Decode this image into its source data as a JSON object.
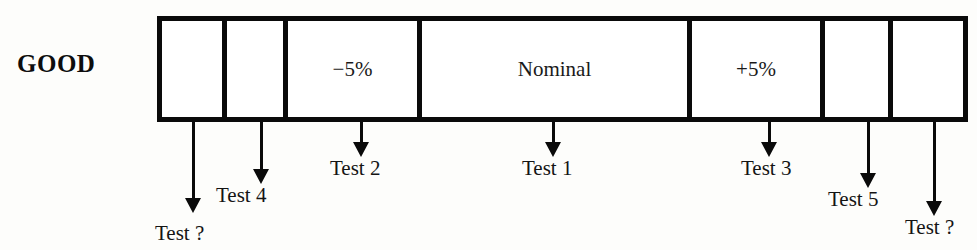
{
  "diagram": {
    "side_label": "GOOD",
    "bar": {
      "cells": [
        {
          "name": "cell-blank-left-outer",
          "label": "",
          "width": 65
        },
        {
          "name": "cell-blank-left-inner",
          "label": "",
          "width": 61
        },
        {
          "name": "cell-minus-5",
          "label": "−5%",
          "width": 134
        },
        {
          "name": "cell-nominal",
          "label": "Nominal",
          "width": 270
        },
        {
          "name": "cell-plus-5",
          "label": "+5%",
          "width": 133
        },
        {
          "name": "cell-blank-right-inner",
          "label": "",
          "width": 68
        },
        {
          "name": "cell-blank-right-outer",
          "label": "",
          "width": 70
        }
      ]
    },
    "pointers": [
      {
        "name": "pointer-test-unknown-left",
        "label": "Test ?",
        "x": 193,
        "shaft_top": 122,
        "shaft_height": 76,
        "label_x": 155,
        "label_y": 221
      },
      {
        "name": "pointer-test-4",
        "label": "Test 4",
        "x": 261,
        "shaft_top": 122,
        "shaft_height": 47,
        "label_x": 216,
        "label_y": 183
      },
      {
        "name": "pointer-test-2",
        "label": "Test 2",
        "x": 361,
        "shaft_top": 122,
        "shaft_height": 20,
        "label_x": 330,
        "label_y": 156
      },
      {
        "name": "pointer-test-1",
        "label": "Test 1",
        "x": 553,
        "shaft_top": 122,
        "shaft_height": 20,
        "label_x": 522,
        "label_y": 156
      },
      {
        "name": "pointer-test-3",
        "label": "Test 3",
        "x": 769,
        "shaft_top": 122,
        "shaft_height": 20,
        "label_x": 741,
        "label_y": 156
      },
      {
        "name": "pointer-test-5",
        "label": "Test 5",
        "x": 868,
        "shaft_top": 122,
        "shaft_height": 51,
        "label_x": 828,
        "label_y": 187
      },
      {
        "name": "pointer-test-unknown-right",
        "label": "Test ?",
        "x": 934,
        "shaft_top": 122,
        "shaft_height": 79,
        "label_x": 905,
        "label_y": 215
      }
    ],
    "colors": {
      "ink": "#0a0a0a",
      "background": "#fdfdfb",
      "cell_fill": "#ffffff"
    }
  }
}
